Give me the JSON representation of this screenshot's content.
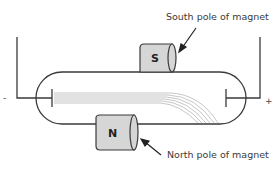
{
  "diagram": {
    "labels": {
      "south_callout": "South pole of magnet",
      "north_callout": "North pole of magnet",
      "south_pole": "S",
      "north_pole": "N",
      "negative_terminal": "-",
      "positive_terminal": "+"
    },
    "colors": {
      "line": "#3a3a3a",
      "magnet_fill": "#d6d6d6",
      "beam": "#9a9a9a",
      "background": "#ffffff"
    }
  }
}
